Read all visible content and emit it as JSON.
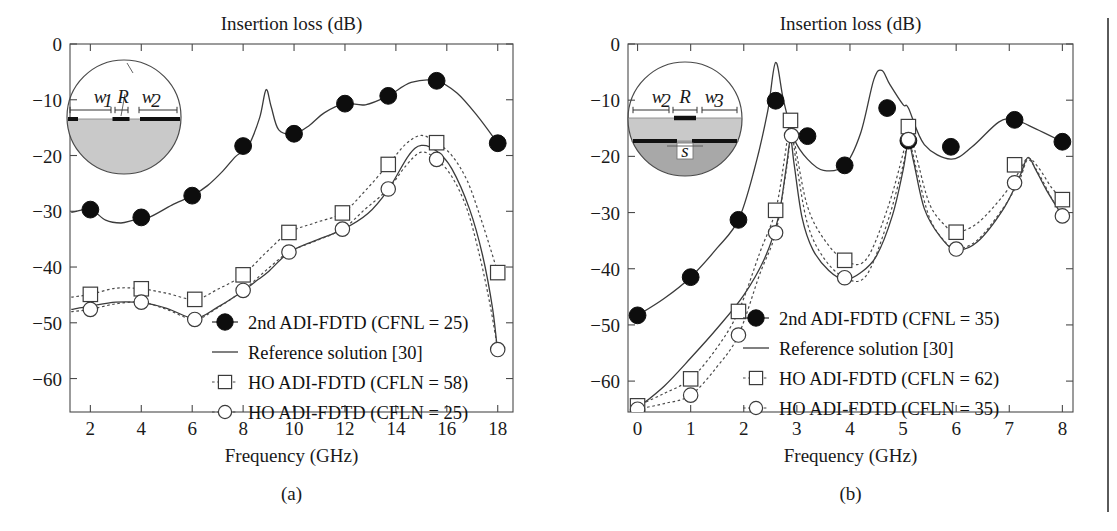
{
  "figure": {
    "panels": [
      {
        "id": "a",
        "caption": "(a)",
        "title": "Insertion loss (dB)",
        "xlabel": "Frequency (GHz)",
        "inset": {
          "name": "circular-waveguide-cross-section-a",
          "labels": [
            "w",
            "1",
            "R",
            "w",
            "2"
          ],
          "label_w1": "w",
          "label_w1_sub": "1",
          "label_R": "R",
          "label_w2": "w",
          "label_w2_sub": "2"
        },
        "legend": [
          {
            "marker": "filled-circle",
            "label": "2nd ADI-FDTD (CFNL = 25)"
          },
          {
            "marker": "solid-line",
            "label": "Reference solution [30]"
          },
          {
            "marker": "open-square",
            "label": "HO ADI-FDTD (CFLN = 58)"
          },
          {
            "marker": "open-circle",
            "label": "HO ADI-FDTD (CFLN = 25)"
          }
        ]
      },
      {
        "id": "b",
        "caption": "(b)",
        "title": "Insertion loss (dB)",
        "xlabel": "Frequency (GHz)",
        "inset": {
          "name": "circular-waveguide-cross-section-b",
          "label_w2": "w",
          "label_w2_sub": "2",
          "label_R": "R",
          "label_w3": "w",
          "label_w3_sub": "3",
          "label_s": "s"
        },
        "legend": [
          {
            "marker": "filled-circle",
            "label": "2nd ADI-FDTD (CFNL = 35)"
          },
          {
            "marker": "solid-line",
            "label": "Reference solution [30]"
          },
          {
            "marker": "open-square",
            "label": "HO ADI-FDTD (CFLN = 62)"
          },
          {
            "marker": "open-circle",
            "label": "HO ADI-FDTD (CFLN = 35)"
          }
        ]
      }
    ]
  },
  "chart_data": [
    {
      "type": "line",
      "panel": "a",
      "title": "Insertion loss (dB)",
      "xlabel": "Frequency (GHz)",
      "ylabel": "Insertion loss (dB)",
      "xlim": [
        1.2,
        18.6
      ],
      "ylim": [
        -66,
        0
      ],
      "xticks": [
        2,
        4,
        6,
        8,
        10,
        12,
        14,
        16,
        18
      ],
      "yticks": [
        0,
        -10,
        -20,
        -30,
        -40,
        -50,
        -60
      ],
      "ytick_labels": [
        "0",
        "−10",
        "−20",
        "−30",
        "−40",
        "−50",
        "−60"
      ],
      "grid": false,
      "legend_position": "lower-center-right",
      "series": [
        {
          "name": "2nd ADI-FDTD (CFNL = 25)",
          "style": "solid-with-filled-circles",
          "marker": "filled-circle",
          "x": [
            2.0,
            4.0,
            6.0,
            8.0,
            10.0,
            12.0,
            13.7,
            15.6,
            18.0
          ],
          "y": [
            -29.7,
            -31.1,
            -27.2,
            -18.3,
            -16.1,
            -10.7,
            -9.3,
            -6.6,
            -17.8
          ],
          "curve_x": [
            1.25,
            2.0,
            2.6,
            3.2,
            3.7,
            4.3,
            5.2,
            6.0,
            6.6,
            7.2,
            7.7,
            8.2,
            8.65,
            8.9,
            9.1,
            9.4,
            10.0,
            10.6,
            11.2,
            12.0,
            12.8,
            13.7,
            14.6,
            15.6,
            16.4,
            17.2,
            18.0
          ],
          "curve_y": [
            -30.2,
            -29.7,
            -31.6,
            -32.1,
            -31.6,
            -31.1,
            -28.9,
            -27.2,
            -25.4,
            -22.8,
            -20.2,
            -18.3,
            -13.2,
            -8.2,
            -11.2,
            -15.4,
            -16.1,
            -14.6,
            -12.3,
            -10.7,
            -10.9,
            -9.3,
            -6.9,
            -6.6,
            -8.8,
            -12.9,
            -17.8
          ]
        },
        {
          "name": "Reference solution [30]",
          "style": "solid",
          "marker": "none",
          "x": [
            1.25,
            2.0,
            3.0,
            4.0,
            5.0,
            6.1,
            7.0,
            8.0,
            8.6,
            9.0,
            9.8,
            10.8,
            11.9,
            12.9,
            13.7,
            14.5,
            15.0,
            15.6,
            16.2,
            16.9,
            17.4,
            17.8,
            18.0
          ],
          "y": [
            -47.6,
            -47.0,
            -46.3,
            -46.4,
            -47.4,
            -49.2,
            -47.2,
            -44.3,
            -42.2,
            -40.8,
            -37.4,
            -35.3,
            -33.3,
            -30.4,
            -26.1,
            -20.0,
            -18.2,
            -19.2,
            -22.4,
            -29.7,
            -37.8,
            -47.5,
            -55.5
          ]
        },
        {
          "name": "HO ADI-FDTD (CFLN = 58)",
          "style": "dotted-with-open-squares",
          "marker": "open-square",
          "x": [
            2.0,
            4.0,
            6.1,
            8.0,
            9.8,
            11.9,
            13.7,
            15.6,
            18.0
          ],
          "y": [
            -44.9,
            -43.9,
            -45.8,
            -41.4,
            -33.8,
            -30.3,
            -21.6,
            -17.7,
            -41.0
          ],
          "curve_x": [
            1.25,
            2.0,
            3.0,
            4.0,
            5.0,
            6.1,
            7.0,
            8.0,
            8.9,
            9.8,
            10.8,
            11.9,
            12.8,
            13.7,
            14.4,
            15.0,
            15.6,
            16.2,
            16.8,
            17.3,
            17.7,
            18.0
          ],
          "curve_y": [
            -45.4,
            -44.9,
            -43.8,
            -43.9,
            -44.7,
            -45.8,
            -44.0,
            -41.4,
            -37.4,
            -33.8,
            -32.1,
            -30.3,
            -26.3,
            -21.6,
            -17.9,
            -16.4,
            -17.7,
            -20.0,
            -24.5,
            -30.8,
            -36.5,
            -41.0
          ]
        },
        {
          "name": "HO ADI-FDTD (CFLN = 25)",
          "style": "dotted-with-open-circles",
          "marker": "open-circle",
          "x": [
            2.0,
            4.0,
            6.1,
            8.0,
            9.8,
            11.9,
            13.7,
            15.6,
            18.0
          ],
          "y": [
            -47.6,
            -46.3,
            -49.4,
            -44.2,
            -37.3,
            -33.2,
            -26.0,
            -20.7,
            -54.8
          ],
          "curve_x": [
            1.25,
            2.0,
            3.0,
            4.0,
            5.0,
            6.1,
            7.0,
            8.0,
            8.9,
            9.8,
            10.8,
            11.9,
            12.8,
            13.7,
            14.4,
            15.0,
            15.6,
            16.2,
            16.8,
            17.3,
            17.7,
            18.0
          ],
          "curve_y": [
            -48.0,
            -47.6,
            -46.6,
            -46.3,
            -47.6,
            -49.4,
            -47.3,
            -44.2,
            -40.6,
            -37.3,
            -35.4,
            -33.2,
            -29.6,
            -26.0,
            -21.8,
            -19.4,
            -20.7,
            -23.8,
            -29.7,
            -38.2,
            -46.8,
            -54.8
          ]
        }
      ]
    },
    {
      "type": "line",
      "panel": "b",
      "title": "Insertion loss (dB)",
      "xlabel": "Frequency (GHz)",
      "ylabel": "Insertion loss (dB)",
      "xlim": [
        -0.18,
        8.2
      ],
      "ylim": [
        -65.5,
        0
      ],
      "xticks": [
        0,
        1,
        2,
        3,
        4,
        5,
        6,
        7,
        8
      ],
      "yticks": [
        0,
        -10,
        -20,
        -30,
        -40,
        -50,
        -60
      ],
      "ytick_labels": [
        "0",
        "−10",
        "−20",
        "−30",
        "−40",
        "−50",
        "−60"
      ],
      "grid": false,
      "legend_position": "lower-center-right",
      "series": [
        {
          "name": "2nd ADI-FDTD (CFNL = 35)",
          "style": "solid-with-filled-circles",
          "marker": "filled-circle",
          "x": [
            0.0,
            1.0,
            1.9,
            2.6,
            3.2,
            3.9,
            4.7,
            5.1,
            5.9,
            7.1,
            8.0
          ],
          "y": [
            -48.3,
            -41.5,
            -31.3,
            -10.1,
            -16.4,
            -21.6,
            -11.4,
            -17.2,
            -18.3,
            -13.5,
            -17.4
          ],
          "curve_x": [
            -0.1,
            0.0,
            0.5,
            1.0,
            1.5,
            1.9,
            2.2,
            2.45,
            2.6,
            2.75,
            2.95,
            3.2,
            3.5,
            3.9,
            4.2,
            4.45,
            4.6,
            4.75,
            5.0,
            5.1,
            5.4,
            5.9,
            6.3,
            6.8,
            7.1,
            7.5,
            8.0
          ],
          "curve_y": [
            -48.8,
            -48.3,
            -45.3,
            -41.5,
            -36.3,
            -31.3,
            -22.3,
            -12.0,
            -3.3,
            -10.1,
            -16.9,
            -20.5,
            -22.5,
            -21.6,
            -15.9,
            -6.3,
            -4.7,
            -7.2,
            -10.8,
            -11.4,
            -17.9,
            -20.5,
            -18.3,
            -13.9,
            -13.5,
            -15.1,
            -17.4
          ]
        },
        {
          "name": "Reference solution [30]",
          "style": "solid",
          "marker": "none",
          "x": [
            -0.1,
            0.0,
            0.5,
            1.0,
            1.5,
            2.0,
            2.4,
            2.65,
            2.8,
            2.88,
            2.95,
            3.1,
            3.3,
            3.6,
            3.9,
            4.2,
            4.5,
            4.8,
            5.0,
            5.1,
            5.2,
            5.4,
            5.7,
            6.0,
            6.4,
            6.9,
            7.2,
            7.35,
            7.5,
            7.7,
            8.0
          ],
          "y": [
            -65.5,
            -64.8,
            -60.9,
            -55.9,
            -50.6,
            -44.7,
            -38.0,
            -30.9,
            -22.0,
            -17.0,
            -21.5,
            -31.0,
            -36.6,
            -40.3,
            -41.9,
            -40.7,
            -37.7,
            -30.5,
            -22.5,
            -17.5,
            -21.0,
            -29.3,
            -34.3,
            -36.6,
            -35.2,
            -29.2,
            -23.5,
            -20.2,
            -22.4,
            -26.0,
            -30.6
          ]
        },
        {
          "name": "HO ADI-FDTD (CFLN = 62)",
          "style": "dotted-with-open-squares",
          "marker": "open-square",
          "x": [
            0.0,
            1.0,
            1.9,
            2.6,
            2.88,
            3.9,
            5.1,
            6.0,
            7.1,
            8.0
          ],
          "y": [
            -64.4,
            -59.6,
            -47.6,
            -29.6,
            -13.6,
            -38.5,
            -14.7,
            -33.5,
            -21.5,
            -27.7
          ],
          "curve_x": [
            -0.1,
            0.0,
            0.5,
            1.0,
            1.5,
            1.9,
            2.3,
            2.6,
            2.78,
            2.88,
            3.0,
            3.2,
            3.5,
            3.9,
            4.3,
            4.7,
            5.0,
            5.1,
            5.25,
            5.5,
            5.8,
            6.0,
            6.4,
            6.9,
            7.2,
            7.35,
            7.55,
            7.8,
            8.0
          ],
          "curve_y": [
            -65.0,
            -64.4,
            -62.2,
            -59.6,
            -54.0,
            -47.6,
            -37.2,
            -29.6,
            -19.6,
            -13.6,
            -19.8,
            -28.9,
            -34.6,
            -38.5,
            -38.4,
            -29.5,
            -19.5,
            -14.7,
            -20.0,
            -28.5,
            -32.4,
            -33.5,
            -31.9,
            -26.8,
            -22.5,
            -20.3,
            -22.0,
            -25.6,
            -27.7
          ]
        },
        {
          "name": "HO ADI-FDTD (CFLN = 35)",
          "style": "dotted-with-open-circles",
          "marker": "open-circle",
          "x": [
            0.0,
            1.0,
            1.9,
            2.6,
            2.9,
            3.9,
            5.1,
            6.0,
            7.1,
            8.0
          ],
          "y": [
            -65.0,
            -62.5,
            -51.8,
            -33.6,
            -16.3,
            -41.6,
            -17.0,
            -36.5,
            -24.7,
            -30.6
          ],
          "curve_x": [
            -0.1,
            0.0,
            0.5,
            1.0,
            1.5,
            1.9,
            2.3,
            2.6,
            2.8,
            2.9,
            3.0,
            3.2,
            3.5,
            3.9,
            4.3,
            4.7,
            5.0,
            5.1,
            5.25,
            5.5,
            5.8,
            6.0,
            6.4,
            6.9,
            7.2,
            7.35,
            7.55,
            7.8,
            8.0
          ],
          "curve_y": [
            -65.4,
            -65.0,
            -64.0,
            -62.5,
            -57.4,
            -51.8,
            -41.0,
            -33.6,
            -22.5,
            -16.3,
            -21.8,
            -32.0,
            -38.0,
            -41.6,
            -41.3,
            -31.9,
            -21.6,
            -17.0,
            -22.2,
            -31.0,
            -35.3,
            -36.5,
            -34.9,
            -29.0,
            -24.0,
            -20.6,
            -23.0,
            -27.5,
            -30.6
          ]
        }
      ]
    }
  ]
}
